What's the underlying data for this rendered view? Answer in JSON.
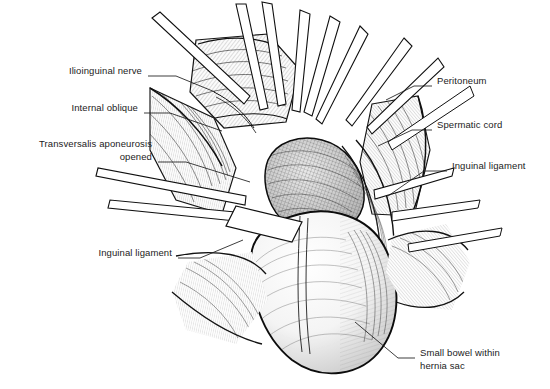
{
  "figure": {
    "style": "pen-and-ink line drawing with cross-hatching",
    "background_color": "#ffffff",
    "ink_color": "#1b1b1b",
    "label_font_size_px": 9.5
  },
  "labels": [
    {
      "id": "ilioinguinal-nerve",
      "text": "Ilioinguinal nerve",
      "align": "right",
      "text_x": 142,
      "text_y": 70,
      "leader": [
        [
          148,
          76
        ],
        [
          176,
          76
        ],
        [
          215,
          92
        ]
      ]
    },
    {
      "id": "internal-oblique",
      "text": "Internal oblique",
      "align": "right",
      "text_x": 138,
      "text_y": 107,
      "leader": [
        [
          144,
          113
        ],
        [
          170,
          113
        ],
        [
          222,
          131
        ]
      ]
    },
    {
      "id": "transversalis-aponeurosis-opened",
      "text": "Transversalis aponeurosis\nopened",
      "align": "right",
      "text_x": 152,
      "text_y": 143,
      "leader": [
        [
          158,
          162
        ],
        [
          186,
          162
        ],
        [
          250,
          182
        ]
      ]
    },
    {
      "id": "inguinal-ligament-left",
      "text": "Inguinal ligament",
      "align": "right",
      "text_x": 172,
      "text_y": 252,
      "leader": [
        [
          178,
          258
        ],
        [
          200,
          258
        ],
        [
          243,
          240
        ]
      ]
    },
    {
      "id": "peritoneum",
      "text": "Peritoneum",
      "align": "left",
      "text_x": 437,
      "text_y": 80,
      "leader": [
        [
          432,
          86
        ],
        [
          414,
          86
        ],
        [
          386,
          100
        ]
      ]
    },
    {
      "id": "spermatic-cord",
      "text": "Spermatic cord",
      "align": "left",
      "text_x": 437,
      "text_y": 124,
      "leader": [
        [
          432,
          130
        ],
        [
          412,
          130
        ],
        [
          378,
          146
        ]
      ]
    },
    {
      "id": "inguinal-ligament-right",
      "text": "Inguinal ligament",
      "align": "left",
      "text_x": 452,
      "text_y": 165,
      "leader": [
        [
          447,
          171
        ],
        [
          424,
          171
        ],
        [
          388,
          196
        ]
      ]
    },
    {
      "id": "small-bowel-within-hernia-sac",
      "text": "Small bowel within\nhernia sac",
      "align": "left",
      "text_x": 420,
      "text_y": 352,
      "leader": [
        [
          415,
          358
        ],
        [
          398,
          358
        ],
        [
          355,
          322
        ]
      ]
    }
  ],
  "structures": [
    {
      "id": "hernia-sac",
      "name": "Small bowel within hernia sac"
    },
    {
      "id": "spermatic-cord",
      "name": "Spermatic cord"
    },
    {
      "id": "peritoneum",
      "name": "Peritoneum"
    },
    {
      "id": "internal-oblique",
      "name": "Internal oblique muscle"
    },
    {
      "id": "transversalis-aponeurosis",
      "name": "Transversalis aponeurosis, opened"
    },
    {
      "id": "inguinal-ligament",
      "name": "Inguinal ligament"
    },
    {
      "id": "ilioinguinal-nerve",
      "name": "Ilioinguinal nerve"
    },
    {
      "id": "retractors",
      "name": "Surgical retractors and instruments"
    }
  ]
}
